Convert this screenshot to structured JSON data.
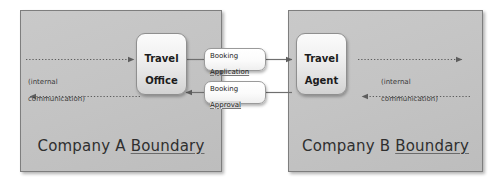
{
  "diagram": {
    "colors": {
      "boundary_fill": "#c5c5c5",
      "boundary_border": "#7e7e7e",
      "actor_fill": "#eeeeee",
      "actor_border": "#8f8f8f",
      "message_fill": "#ffffff",
      "message_border": "#9a9a9a",
      "connector": "#6f6f6f",
      "text": "#1f1f1f",
      "canvas": "#ffffff"
    },
    "boundaries": [
      {
        "id": "company-a",
        "label_prefix": "Company A ",
        "label_underlined": "Boundary",
        "label_full": "Company A Boundary"
      },
      {
        "id": "company-b",
        "label_prefix": "Company B ",
        "label_underlined": "Boundary",
        "label_full": "Company B Boundary"
      }
    ],
    "actors": [
      {
        "id": "travel-office",
        "label": "Travel\nOffice",
        "line1": "Travel",
        "line2": "Office"
      },
      {
        "id": "travel-agent",
        "label": "Travel\nAgent",
        "line1": "Travel",
        "line2": "Agent"
      }
    ],
    "messages": [
      {
        "id": "booking-application",
        "line1": "Booking",
        "line2": "Application",
        "label_full": "Booking Application",
        "direction": "left-to-right"
      },
      {
        "id": "booking-approval",
        "line1": "Booking",
        "line2": "Approval",
        "label_full": "Booking Approval",
        "direction": "right-to-left"
      }
    ],
    "internal_captions": [
      {
        "id": "internal-communication-a",
        "line1": "(internal",
        "line2": "communication)",
        "label_full": "(internal communication)"
      },
      {
        "id": "internal-communication-b",
        "line1": "(internal",
        "line2": "communication)",
        "label_full": "(internal communication)"
      }
    ],
    "connectors": [
      {
        "id": "internal-in-a",
        "style": "dotted",
        "direction": "right"
      },
      {
        "id": "internal-out-a",
        "style": "dotted",
        "direction": "left"
      },
      {
        "id": "internal-out-b",
        "style": "dotted",
        "direction": "right"
      },
      {
        "id": "internal-in-b",
        "style": "dotted",
        "direction": "left"
      },
      {
        "id": "office-to-application",
        "style": "solid",
        "direction": "right"
      },
      {
        "id": "application-to-agent",
        "style": "solid",
        "direction": "right"
      },
      {
        "id": "agent-to-approval",
        "style": "solid",
        "direction": "left"
      },
      {
        "id": "approval-to-office",
        "style": "solid",
        "direction": "left"
      }
    ]
  }
}
